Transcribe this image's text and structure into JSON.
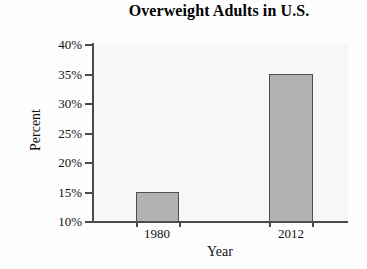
{
  "chart_data": {
    "type": "bar",
    "title": "Overweight Adults in U.S.",
    "xlabel": "Year",
    "ylabel": "Percent",
    "categories": [
      "1980",
      "2012"
    ],
    "values": [
      15,
      34.9
    ],
    "value_labels": [
      "15%",
      "34.9%"
    ],
    "ylim": [
      10,
      40
    ],
    "yticks": [
      10,
      15,
      20,
      25,
      30,
      35,
      40
    ],
    "ytick_labels": [
      "10%",
      "15%",
      "20%",
      "25%",
      "30%",
      "35%",
      "40%"
    ],
    "grid": false,
    "legend": null,
    "series": [
      {
        "name": "Overweight Adults",
        "values": [
          15,
          34.9
        ]
      }
    ],
    "colors": {
      "bar_fill": "#b2b2b2",
      "bar_border": "#4f4f4f",
      "axis": "#4a4a4a",
      "text": "#111111",
      "plot_background": "#f7f7f7",
      "figure_background": "#fdfdfd"
    }
  }
}
